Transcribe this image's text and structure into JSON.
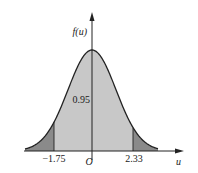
{
  "figure": {
    "type": "normal-distribution-density",
    "y_axis_label": "f(u)",
    "x_axis_label": "u",
    "origin_label": "O",
    "center_area_label": "0.95",
    "left_bound_label": "-1.75",
    "right_bound_label": "2.33",
    "colors": {
      "curve": "#222222",
      "center_fill": "#c8c8c8",
      "tail_fill": "#8a8a8a",
      "axis": "#222222"
    }
  }
}
